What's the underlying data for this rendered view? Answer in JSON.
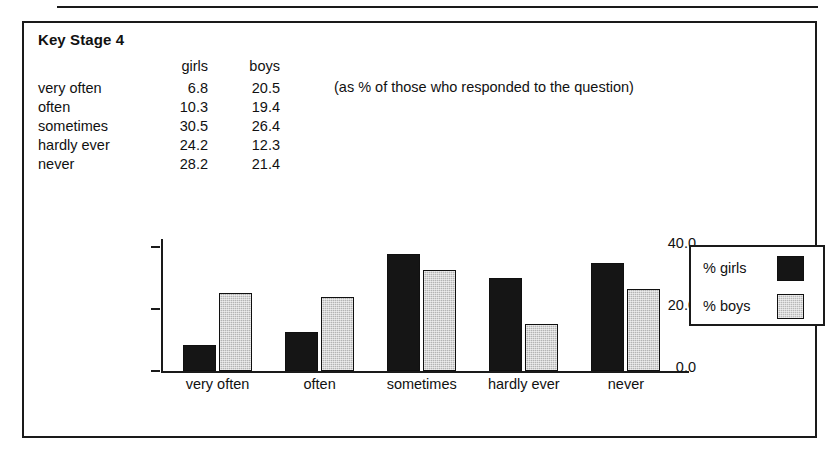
{
  "panel": {
    "title": "Key Stage 4",
    "note": "(as % of those who responded to the question)"
  },
  "table": {
    "headers": [
      "",
      "girls",
      "boys"
    ],
    "rows": [
      {
        "category": "very often",
        "girls": "6.8",
        "boys": "20.5"
      },
      {
        "category": "often",
        "girls": "10.3",
        "boys": "19.4"
      },
      {
        "category": "sometimes",
        "girls": "30.5",
        "boys": "26.4"
      },
      {
        "category": "hardly ever",
        "girls": "24.2",
        "boys": "12.3"
      },
      {
        "category": "never",
        "girls": "28.2",
        "boys": "21.4"
      }
    ]
  },
  "legend": {
    "girls_label": "% girls",
    "boys_label": "% boys"
  },
  "chart_data": {
    "type": "bar",
    "title": "Key Stage 4",
    "subtitle": "(as % of those who responded to the question)",
    "categories": [
      "very often",
      "often",
      "sometimes",
      "hardly ever",
      "never"
    ],
    "series": [
      {
        "name": "% girls",
        "values": [
          6.8,
          10.3,
          30.5,
          24.2,
          28.2
        ],
        "color": "#151515"
      },
      {
        "name": "% boys",
        "values": [
          20.5,
          19.4,
          26.4,
          12.3,
          21.4
        ],
        "color": "#b4b4b4"
      }
    ],
    "xlabel": "",
    "ylabel": "",
    "ylim": [
      0,
      40
    ],
    "yticks": [
      "0.0",
      "20.0",
      "40.0"
    ],
    "grid": false,
    "legend_position": "top-right"
  }
}
